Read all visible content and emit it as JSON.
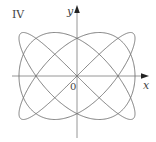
{
  "figure": {
    "panel_label": "IV",
    "x_axis_label": "x",
    "y_axis_label": "y",
    "origin_label": "0",
    "colors": {
      "background": "#ffffff",
      "curve": "#7a7a7a",
      "axes": "#8a8a8a",
      "text": "#444444"
    }
  },
  "curve": {
    "type": "parametric-lissajous",
    "x_expr": "sin(3t)",
    "y_expr": "sin(4t)",
    "x_frequency": 3,
    "y_frequency": 4,
    "passes_through_origin": true
  }
}
